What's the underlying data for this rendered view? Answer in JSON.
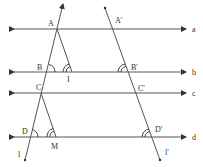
{
  "diagram": {
    "colors": {
      "line": "#555555",
      "text": "#333333",
      "background": "#ffffff"
    },
    "parallel_lines": [
      {
        "label": "a",
        "y": 29
      },
      {
        "label": "b",
        "y": 72
      },
      {
        "label": "c",
        "y": 93
      },
      {
        "label": "d",
        "y": 137
      }
    ],
    "transversals": [
      {
        "label": "l",
        "from": [
          63,
          4
        ],
        "to": [
          25,
          160
        ]
      },
      {
        "label": "l'",
        "from": [
          105,
          8
        ],
        "to": [
          160,
          160
        ]
      }
    ],
    "segments": [
      {
        "from": "A",
        "to": "I"
      },
      {
        "from": "C",
        "to": "M"
      }
    ],
    "points": {
      "A": "A",
      "B": "B",
      "I": "I",
      "C": "C",
      "D": "D",
      "M": "M",
      "A'": "A'",
      "B'": "B'",
      "C'": "C'",
      "D'": "D'"
    },
    "line_labels": {
      "a": "a",
      "b": "b",
      "c": "c",
      "d": "d",
      "l": "l",
      "l_prime": "l'"
    }
  }
}
